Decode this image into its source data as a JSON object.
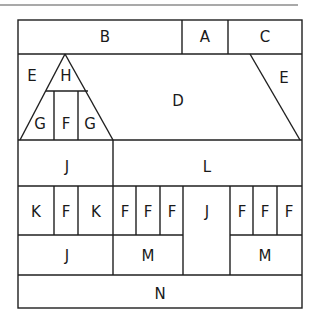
{
  "diagram": {
    "type": "floor-plan-layout",
    "stroke_color": "#1f1f1f",
    "background": "#ffffff",
    "regions": [
      {
        "id": "B",
        "label": "B",
        "x": 105,
        "y": 37
      },
      {
        "id": "A",
        "label": "A",
        "x": 205,
        "y": 37
      },
      {
        "id": "C",
        "label": "C",
        "x": 265,
        "y": 37
      },
      {
        "id": "E_left",
        "label": "E",
        "x": 32,
        "y": 76
      },
      {
        "id": "H",
        "label": "H",
        "x": 66,
        "y": 76
      },
      {
        "id": "D",
        "label": "D",
        "x": 178,
        "y": 101
      },
      {
        "id": "E_right",
        "label": "E",
        "x": 284,
        "y": 78
      },
      {
        "id": "G_left",
        "label": "G",
        "x": 40,
        "y": 124
      },
      {
        "id": "F_tri",
        "label": "F",
        "x": 66,
        "y": 124
      },
      {
        "id": "G_right",
        "label": "G",
        "x": 90,
        "y": 124
      },
      {
        "id": "J_top",
        "label": "J",
        "x": 67,
        "y": 167
      },
      {
        "id": "L",
        "label": "L",
        "x": 207,
        "y": 167
      },
      {
        "id": "K1",
        "label": "K",
        "x": 36,
        "y": 212
      },
      {
        "id": "F1",
        "label": "F",
        "x": 66,
        "y": 212
      },
      {
        "id": "K2",
        "label": "K",
        "x": 96,
        "y": 212
      },
      {
        "id": "F2",
        "label": "F",
        "x": 125,
        "y": 212
      },
      {
        "id": "F3",
        "label": "F",
        "x": 148,
        "y": 212
      },
      {
        "id": "F4",
        "label": "F",
        "x": 172,
        "y": 212
      },
      {
        "id": "J_mid",
        "label": "J",
        "x": 207,
        "y": 212
      },
      {
        "id": "F5",
        "label": "F",
        "x": 242,
        "y": 212
      },
      {
        "id": "F6",
        "label": "F",
        "x": 265,
        "y": 212
      },
      {
        "id": "F7",
        "label": "F",
        "x": 289,
        "y": 212
      },
      {
        "id": "J_bot",
        "label": "J",
        "x": 67,
        "y": 256
      },
      {
        "id": "M1",
        "label": "M",
        "x": 148,
        "y": 256
      },
      {
        "id": "M2",
        "label": "M",
        "x": 265,
        "y": 256
      },
      {
        "id": "N",
        "label": "N",
        "x": 160,
        "y": 294
      }
    ]
  }
}
